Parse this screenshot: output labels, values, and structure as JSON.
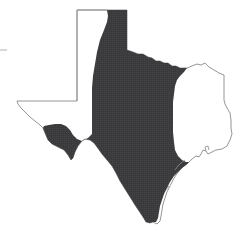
{
  "map": {
    "subject": "Texas state outline with shaded range",
    "colors": {
      "background": "#ffffff",
      "outline": "#8a8a8a",
      "range_fill": "#3a3a3c"
    },
    "regions": [
      {
        "name": "Texas outline",
        "type": "state-boundary"
      },
      {
        "name": "Shaded distribution range",
        "type": "range"
      }
    ]
  }
}
